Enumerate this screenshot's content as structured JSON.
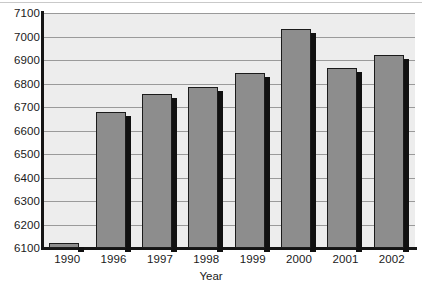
{
  "chart_data": {
    "type": "bar",
    "title": "",
    "subtitle": "",
    "xlabel": "Year",
    "ylabel": "",
    "categories": [
      "1990",
      "1996",
      "1997",
      "1998",
      "1999",
      "2000",
      "2001",
      "2002"
    ],
    "values": [
      6120,
      6680,
      6755,
      6785,
      6845,
      7030,
      6865,
      6920
    ],
    "series": [
      {
        "name": "Value",
        "values": [
          6120,
          6680,
          6755,
          6785,
          6845,
          7030,
          6865,
          6920
        ]
      }
    ],
    "ylim": [
      6100,
      7100
    ],
    "yticks": [
      6100,
      6200,
      6300,
      6400,
      6500,
      6600,
      6700,
      6800,
      6900,
      7000,
      7100
    ],
    "ytick_labels": [
      "6100",
      "6200",
      "6300",
      "6400",
      "6500",
      "6600",
      "6700",
      "6800",
      "6900",
      "7000",
      "7100"
    ],
    "grid": true,
    "grid_axis": "y",
    "legend": false,
    "legend_position": "none",
    "bar_style": "3d-shadow",
    "colors": {
      "bar_fill": "#8d8d8d",
      "bar_outline": "#1b1b1b",
      "bar_shadow": "#111111",
      "plot_background": "#ededed",
      "gridline": "#9a9a9a",
      "axis": "#151515",
      "text": "#1a1a1a",
      "page_background": "#ffffff"
    }
  }
}
